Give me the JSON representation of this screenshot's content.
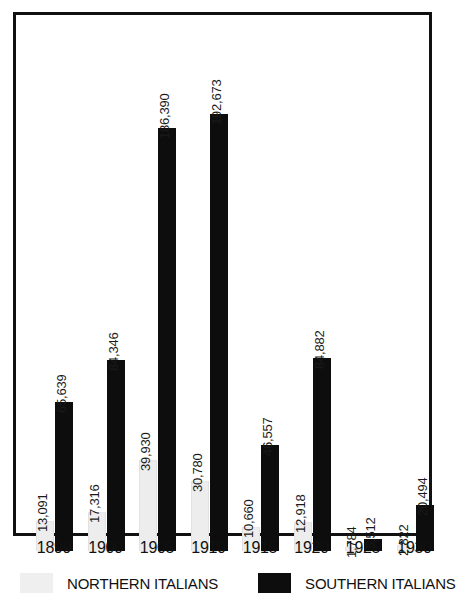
{
  "chart_data": {
    "type": "bar",
    "title": "",
    "subtitle": "",
    "xlabel": "",
    "ylabel": "",
    "grid": false,
    "legend_position": "bottom",
    "ylim": [
      0,
      200000
    ],
    "categories": [
      "1899",
      "1900",
      "1905",
      "1910",
      "1915",
      "1920",
      "1925",
      "1930"
    ],
    "series": [
      {
        "name": "NORTHERN ITALIANS",
        "color": "#efefef",
        "values": [
          13091,
          17316,
          39930,
          30780,
          10660,
          12918,
          1784,
          2822
        ],
        "labels": [
          "13,091",
          "17,316",
          "39,930",
          "30,780",
          "10,660",
          "12,918",
          "1,784",
          "2,822"
        ]
      },
      {
        "name": "SOUTHERN ITALIANS",
        "color": "#0d0d0d",
        "values": [
          65639,
          84346,
          186390,
          192673,
          46557,
          84882,
          5512,
          20494
        ],
        "labels": [
          "65,639",
          "84,346",
          "186,390",
          "192,673",
          "46,557",
          "84,882",
          "5,512",
          "20,494"
        ]
      }
    ]
  },
  "legend": {
    "items": [
      {
        "label": "NORTHERN ITALIANS",
        "swatch": "light-gray-swatch"
      },
      {
        "label": "SOUTHERN ITALIANS",
        "swatch": "black-swatch"
      }
    ]
  },
  "axis": {
    "x_tick_labels": [
      "1899",
      "1900",
      "1905",
      "1910",
      "1915",
      "1920",
      "1925",
      "1930"
    ]
  }
}
